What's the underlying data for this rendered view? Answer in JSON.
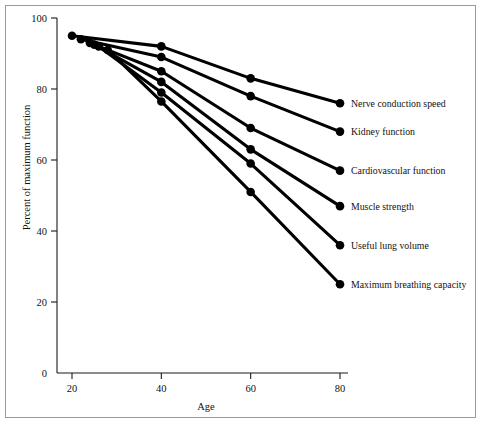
{
  "figure": {
    "name": "physiological-decline-line-chart",
    "background_color": "#ffffff",
    "border_color": "#9a9a9a",
    "line_color": "#000000",
    "text_color": "#111111"
  },
  "chart_data": {
    "type": "line",
    "title": "",
    "xlabel": "Age",
    "ylabel": "Percent of maximum function",
    "xlim": [
      0,
      88
    ],
    "ylim": [
      0,
      100
    ],
    "xticks": [
      20,
      40,
      60,
      80
    ],
    "xtick_labels": [
      "20",
      "40",
      "60",
      "80"
    ],
    "yticks": [
      0,
      20,
      40,
      60,
      80,
      100
    ],
    "ytick_labels": [
      "0",
      "20",
      "40",
      "60",
      "80",
      "100"
    ],
    "grid": false,
    "legend_position": "right-of-line-endpoints",
    "marker": "filled-circle",
    "series": [
      {
        "name": "Nerve conduction speed",
        "x": [
          20,
          40,
          60,
          80
        ],
        "values": [
          95,
          92,
          83,
          76
        ],
        "label_x": 80,
        "label_y": 76
      },
      {
        "name": "Kidney function",
        "x": [
          22,
          40,
          60,
          80
        ],
        "values": [
          94,
          89,
          78,
          68
        ],
        "label_x": 80,
        "label_y": 68
      },
      {
        "name": "Cardiovascular function",
        "x": [
          24,
          40,
          60,
          80
        ],
        "values": [
          93,
          85,
          69,
          57
        ],
        "label_x": 80,
        "label_y": 57
      },
      {
        "name": "Muscle strength",
        "x": [
          25,
          40,
          60,
          80
        ],
        "values": [
          92.5,
          82,
          63,
          47
        ],
        "label_x": 80,
        "label_y": 47
      },
      {
        "name": "Useful lung volume",
        "x": [
          26,
          40,
          60,
          80
        ],
        "values": [
          92,
          79,
          59,
          36
        ],
        "label_x": 80,
        "label_y": 36
      },
      {
        "name": "Maximum breathing capacity",
        "x": [
          28,
          40,
          60,
          80
        ],
        "values": [
          91,
          76.5,
          51,
          25
        ],
        "label_x": 80,
        "label_y": 25
      }
    ]
  }
}
